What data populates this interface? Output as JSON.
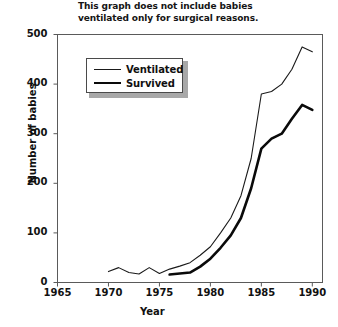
{
  "annotation": {
    "line1": "This graph does not include babies",
    "line2": "ventilated only for surgical reasons."
  },
  "axis": {
    "ylabel": "Number of babies",
    "xlabel": "Year",
    "yticks": [
      "0",
      "100",
      "200",
      "300",
      "400",
      "500"
    ],
    "xticks": [
      "1965",
      "1970",
      "1975",
      "1980",
      "1985",
      "1990"
    ]
  },
  "legend": {
    "items": [
      {
        "label": "Ventilated",
        "style": "thin"
      },
      {
        "label": "Survived",
        "style": "thick"
      }
    ]
  },
  "chart_data": {
    "type": "line",
    "title": "This graph does not include babies ventilated only for surgical reasons.",
    "xlabel": "Year",
    "ylabel": "Number of babies",
    "xlim": [
      1965,
      1991
    ],
    "ylim": [
      0,
      500
    ],
    "ytick_values": [
      0,
      100,
      200,
      300,
      400,
      500
    ],
    "xtick_values": [
      1965,
      1970,
      1975,
      1980,
      1985,
      1990
    ],
    "grid": false,
    "legend_position": "upper-left-inside",
    "series": [
      {
        "name": "Ventilated",
        "line_width": "thin",
        "color": "#1a1a1a",
        "points": [
          {
            "x": 1970,
            "y": 22
          },
          {
            "x": 1971,
            "y": 30
          },
          {
            "x": 1972,
            "y": 20
          },
          {
            "x": 1973,
            "y": 17
          },
          {
            "x": 1974,
            "y": 30
          },
          {
            "x": 1975,
            "y": 18
          },
          {
            "x": 1976,
            "y": 27
          },
          {
            "x": 1977,
            "y": 33
          },
          {
            "x": 1978,
            "y": 40
          },
          {
            "x": 1979,
            "y": 55
          },
          {
            "x": 1980,
            "y": 72
          },
          {
            "x": 1981,
            "y": 100
          },
          {
            "x": 1982,
            "y": 130
          },
          {
            "x": 1983,
            "y": 175
          },
          {
            "x": 1984,
            "y": 250
          },
          {
            "x": 1985,
            "y": 380
          },
          {
            "x": 1986,
            "y": 385
          },
          {
            "x": 1987,
            "y": 400
          },
          {
            "x": 1988,
            "y": 430
          },
          {
            "x": 1989,
            "y": 475
          },
          {
            "x": 1990,
            "y": 465
          }
        ]
      },
      {
        "name": "Survived",
        "line_width": "thick",
        "color": "#0a0a0a",
        "points": [
          {
            "x": 1976,
            "y": 16
          },
          {
            "x": 1977,
            "y": 18
          },
          {
            "x": 1978,
            "y": 20
          },
          {
            "x": 1979,
            "y": 32
          },
          {
            "x": 1980,
            "y": 48
          },
          {
            "x": 1981,
            "y": 70
          },
          {
            "x": 1982,
            "y": 95
          },
          {
            "x": 1983,
            "y": 130
          },
          {
            "x": 1984,
            "y": 190
          },
          {
            "x": 1985,
            "y": 270
          },
          {
            "x": 1986,
            "y": 290
          },
          {
            "x": 1987,
            "y": 300
          },
          {
            "x": 1988,
            "y": 330
          },
          {
            "x": 1989,
            "y": 358
          },
          {
            "x": 1990,
            "y": 348
          }
        ]
      }
    ]
  }
}
